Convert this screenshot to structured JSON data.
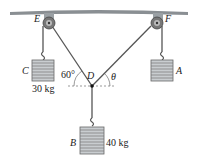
{
  "figure": {
    "points": {
      "E": "E",
      "F": "F",
      "D": "D"
    },
    "weights": [
      {
        "label": "C",
        "mass": "30 kg"
      },
      {
        "label": "A",
        "mass": ""
      },
      {
        "label": "B",
        "mass": "40 kg"
      }
    ],
    "angles": {
      "left": "60°",
      "right": "θ"
    }
  }
}
